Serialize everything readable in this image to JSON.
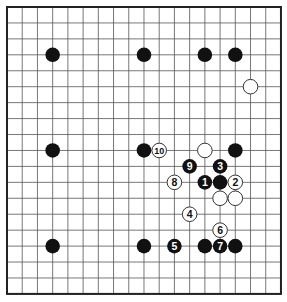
{
  "diagram": {
    "type": "go-board",
    "size": 19,
    "origin": {
      "x": 7,
      "y": 7
    },
    "spacing": {
      "x": 15.22,
      "y": 15.94
    },
    "stone_radius": 7.3,
    "colors": {
      "background": "#ffffff",
      "grid": "#555555",
      "border": "#222222",
      "black_stone": "#111111",
      "white_stone": "#ffffff",
      "white_outline": "#333333"
    },
    "stones": [
      {
        "color": "black",
        "col": 3,
        "row": 3
      },
      {
        "color": "black",
        "col": 9,
        "row": 3
      },
      {
        "color": "black",
        "col": 13,
        "row": 3
      },
      {
        "color": "black",
        "col": 15,
        "row": 3
      },
      {
        "color": "white",
        "col": 16,
        "row": 5
      },
      {
        "color": "black",
        "col": 3,
        "row": 9
      },
      {
        "color": "black",
        "col": 9,
        "row": 9
      },
      {
        "color": "white",
        "col": 13,
        "row": 9
      },
      {
        "color": "black",
        "col": 15,
        "row": 9
      },
      {
        "color": "black",
        "col": 14,
        "row": 11
      },
      {
        "color": "white",
        "col": 14,
        "row": 12
      },
      {
        "color": "white",
        "col": 15,
        "row": 12
      },
      {
        "color": "black",
        "col": 3,
        "row": 15
      },
      {
        "color": "black",
        "col": 9,
        "row": 15
      },
      {
        "color": "black",
        "col": 13,
        "row": 15
      },
      {
        "color": "black",
        "col": 15,
        "row": 15
      },
      {
        "color": "black",
        "col": 13,
        "row": 11,
        "label": "1"
      },
      {
        "color": "white",
        "col": 15,
        "row": 11,
        "label": "2"
      },
      {
        "color": "black",
        "col": 14,
        "row": 10,
        "label": "3"
      },
      {
        "color": "white",
        "col": 12,
        "row": 13,
        "label": "4"
      },
      {
        "color": "black",
        "col": 11,
        "row": 15,
        "label": "5"
      },
      {
        "color": "white",
        "col": 14,
        "row": 14,
        "label": "6"
      },
      {
        "color": "black",
        "col": 14,
        "row": 15,
        "label": "7"
      },
      {
        "color": "white",
        "col": 11,
        "row": 11,
        "label": "8"
      },
      {
        "color": "black",
        "col": 12,
        "row": 10,
        "label": "9"
      },
      {
        "color": "white",
        "col": 10,
        "row": 9,
        "label": "10"
      }
    ]
  }
}
